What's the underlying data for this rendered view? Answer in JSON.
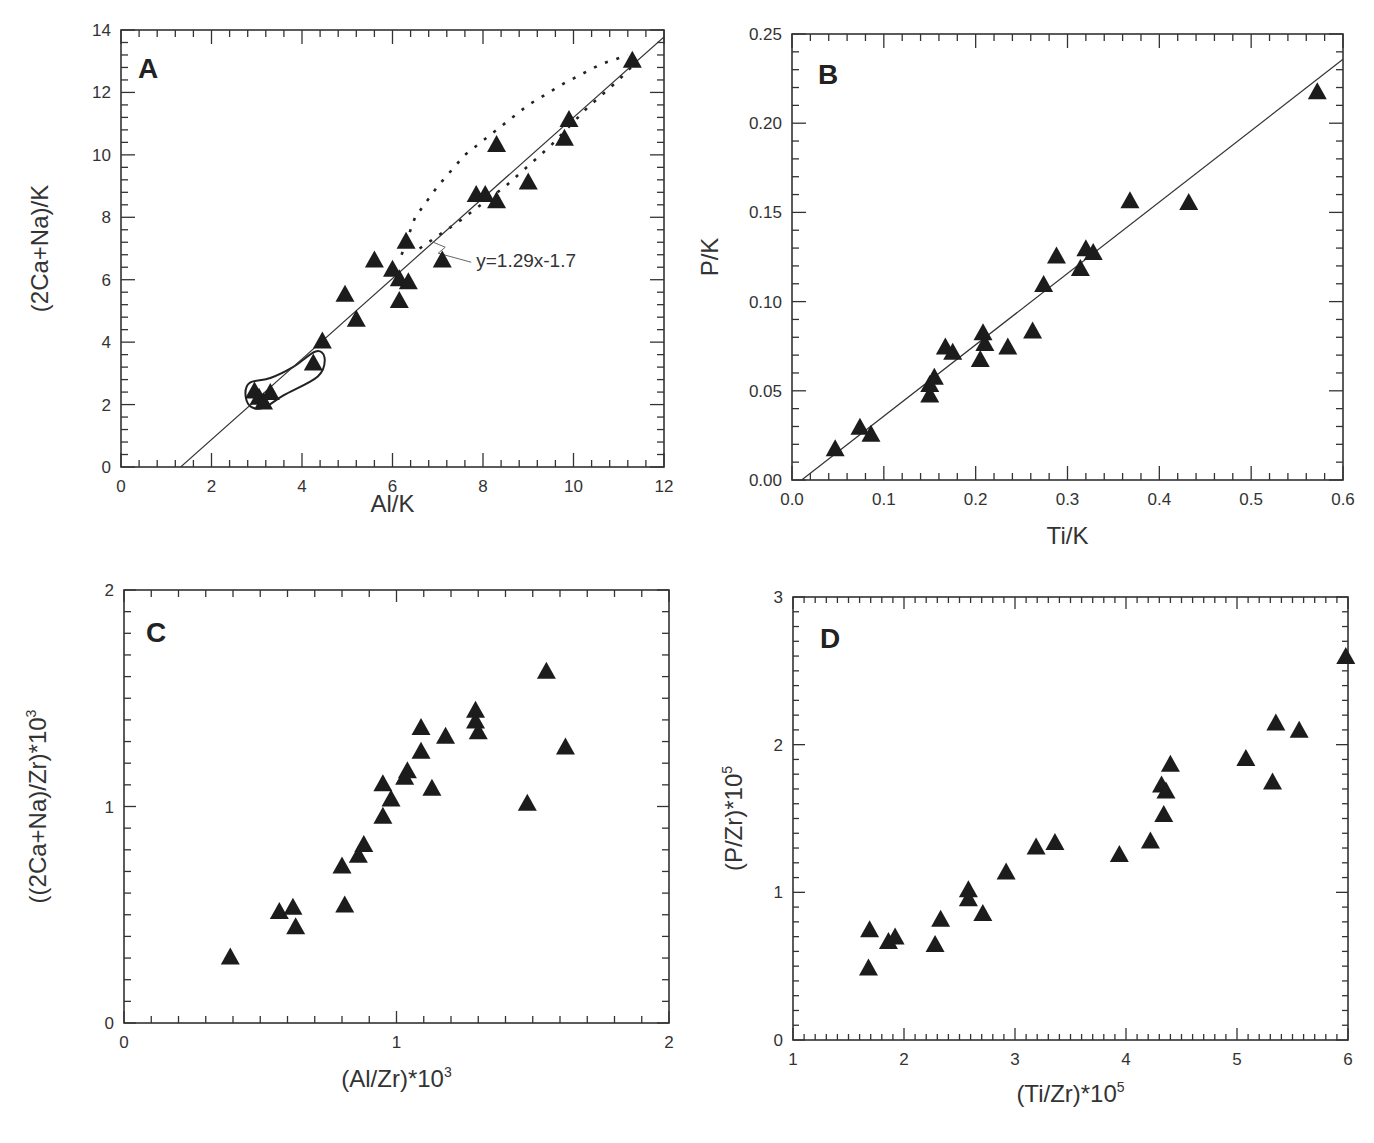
{
  "figure": {
    "marker_color": "#1c1c1c",
    "line_color": "#333333"
  },
  "chart_data": [
    {
      "id": "A",
      "type": "scatter",
      "panel_letter": "A",
      "xlabel": "Al/K",
      "ylabel": "(2Ca+Na)/K",
      "xlim": [
        0,
        12
      ],
      "ylim": [
        0,
        14
      ],
      "x_ticks": [
        0,
        2,
        4,
        6,
        8,
        10,
        12
      ],
      "y_ticks": [
        0,
        2,
        4,
        6,
        8,
        10,
        12,
        14
      ],
      "x_minor_step": 0.4,
      "y_minor_step": 0.4,
      "marker": "triangle",
      "grid": false,
      "fit": {
        "slope": 1.29,
        "intercept": -1.7,
        "label": "y=1.29x-1.7",
        "x_range": [
          1.32,
          12
        ]
      },
      "annotations": [
        {
          "type": "dotted-envelope",
          "upper": [
            [
              6.2,
              6.8
            ],
            [
              6.5,
              8.0
            ],
            [
              7.0,
              9.0
            ],
            [
              7.6,
              10.0
            ],
            [
              8.3,
              10.8
            ],
            [
              9.0,
              11.6
            ],
            [
              9.8,
              12.3
            ],
            [
              10.6,
              12.9
            ],
            [
              11.2,
              13.2
            ]
          ],
          "lower": [
            [
              6.6,
              7.0
            ],
            [
              7.5,
              7.9
            ],
            [
              8.5,
              9.0
            ],
            [
              9.5,
              10.3
            ],
            [
              10.3,
              11.5
            ],
            [
              11.0,
              12.4
            ],
            [
              11.4,
              13.0
            ]
          ]
        },
        {
          "type": "enclosed-field",
          "points": [
            [
              2.75,
              2.35
            ],
            [
              2.85,
              2.7
            ],
            [
              3.3,
              2.85
            ],
            [
              3.8,
              3.2
            ],
            [
              4.3,
              3.7
            ],
            [
              4.5,
              3.5
            ],
            [
              4.35,
              2.9
            ],
            [
              3.6,
              2.3
            ],
            [
              3.15,
              1.9
            ],
            [
              2.85,
              1.95
            ]
          ]
        }
      ],
      "points": [
        [
          2.95,
          2.4
        ],
        [
          3.05,
          2.2
        ],
        [
          3.15,
          2.05
        ],
        [
          3.3,
          2.35
        ],
        [
          4.25,
          3.3
        ],
        [
          4.45,
          4.0
        ],
        [
          4.95,
          5.5
        ],
        [
          5.2,
          4.7
        ],
        [
          5.6,
          6.6
        ],
        [
          6.0,
          6.3
        ],
        [
          6.15,
          6.0
        ],
        [
          6.15,
          5.3
        ],
        [
          6.35,
          5.9
        ],
        [
          6.3,
          7.2
        ],
        [
          7.1,
          6.6
        ],
        [
          7.85,
          8.7
        ],
        [
          8.05,
          8.7
        ],
        [
          8.3,
          8.5
        ],
        [
          8.3,
          10.3
        ],
        [
          9.0,
          9.1
        ],
        [
          9.8,
          10.5
        ],
        [
          9.9,
          11.1
        ],
        [
          11.3,
          13.0
        ]
      ]
    },
    {
      "id": "B",
      "type": "scatter",
      "panel_letter": "B",
      "xlabel": "Ti/K",
      "ylabel": "P/K",
      "xlim": [
        0,
        0.6
      ],
      "ylim": [
        0,
        0.25
      ],
      "x_ticks": [
        "0.0",
        "0.1",
        "0.2",
        "0.3",
        "0.4",
        "0.5",
        "0.6"
      ],
      "y_ticks": [
        "0.00",
        "0.05",
        "0.10",
        "0.15",
        "0.20",
        "0.25"
      ],
      "x_minor_step": 0.02,
      "y_minor_step": 0.01,
      "marker": "triangle",
      "grid": false,
      "fit": {
        "slope": 0.4,
        "intercept": -0.0042,
        "label": "",
        "x_range": [
          0.0105,
          0.6
        ]
      },
      "points": [
        [
          0.047,
          0.017
        ],
        [
          0.074,
          0.029
        ],
        [
          0.086,
          0.025
        ],
        [
          0.15,
          0.047
        ],
        [
          0.15,
          0.053
        ],
        [
          0.155,
          0.057
        ],
        [
          0.167,
          0.074
        ],
        [
          0.175,
          0.071
        ],
        [
          0.205,
          0.067
        ],
        [
          0.208,
          0.082
        ],
        [
          0.21,
          0.076
        ],
        [
          0.235,
          0.074
        ],
        [
          0.262,
          0.083
        ],
        [
          0.274,
          0.109
        ],
        [
          0.288,
          0.125
        ],
        [
          0.314,
          0.118
        ],
        [
          0.32,
          0.129
        ],
        [
          0.328,
          0.127
        ],
        [
          0.368,
          0.156
        ],
        [
          0.432,
          0.155
        ],
        [
          0.572,
          0.217
        ]
      ]
    },
    {
      "id": "C",
      "type": "scatter",
      "panel_letter": "C",
      "xlabel": "(Al/Zr)*10",
      "xlabel_sup": "3",
      "ylabel": "((2Ca+Na)/Zr)*10",
      "ylabel_sup": "3",
      "xlim": [
        0,
        2
      ],
      "ylim": [
        0,
        2
      ],
      "x_ticks": [
        0,
        1,
        2
      ],
      "y_ticks": [
        0,
        1,
        2
      ],
      "x_minor_step": 0.1,
      "y_minor_step": 0.1,
      "marker": "triangle",
      "grid": false,
      "points": [
        [
          0.39,
          0.3
        ],
        [
          0.57,
          0.51
        ],
        [
          0.62,
          0.53
        ],
        [
          0.63,
          0.44
        ],
        [
          0.8,
          0.72
        ],
        [
          0.81,
          0.54
        ],
        [
          0.86,
          0.77
        ],
        [
          0.88,
          0.82
        ],
        [
          0.95,
          0.95
        ],
        [
          0.95,
          1.1
        ],
        [
          0.98,
          1.03
        ],
        [
          1.03,
          1.13
        ],
        [
          1.04,
          1.16
        ],
        [
          1.09,
          1.36
        ],
        [
          1.09,
          1.25
        ],
        [
          1.13,
          1.08
        ],
        [
          1.18,
          1.32
        ],
        [
          1.29,
          1.44
        ],
        [
          1.29,
          1.39
        ],
        [
          1.3,
          1.34
        ],
        [
          1.48,
          1.01
        ],
        [
          1.55,
          1.62
        ],
        [
          1.62,
          1.27
        ]
      ]
    },
    {
      "id": "D",
      "type": "scatter",
      "panel_letter": "D",
      "xlabel": "(Ti/Zr)*10",
      "xlabel_sup": "5",
      "ylabel": "(P/Zr)*10",
      "ylabel_sup": "5",
      "xlim": [
        1,
        6
      ],
      "ylim": [
        0,
        3
      ],
      "x_ticks": [
        1,
        2,
        3,
        4,
        5,
        6
      ],
      "y_ticks": [
        0,
        1,
        2,
        3
      ],
      "x_minor_step": 0.1,
      "y_minor_step": 0.1,
      "marker": "triangle",
      "grid": false,
      "points": [
        [
          1.68,
          0.48
        ],
        [
          1.69,
          0.74
        ],
        [
          1.86,
          0.66
        ],
        [
          1.92,
          0.69
        ],
        [
          2.28,
          0.64
        ],
        [
          2.33,
          0.81
        ],
        [
          2.58,
          1.01
        ],
        [
          2.58,
          0.95
        ],
        [
          2.71,
          0.85
        ],
        [
          2.92,
          1.13
        ],
        [
          3.19,
          1.3
        ],
        [
          3.36,
          1.33
        ],
        [
          3.94,
          1.25
        ],
        [
          4.22,
          1.34
        ],
        [
          4.32,
          1.72
        ],
        [
          4.36,
          1.68
        ],
        [
          4.34,
          1.52
        ],
        [
          4.4,
          1.86
        ],
        [
          5.08,
          1.9
        ],
        [
          5.32,
          1.74
        ],
        [
          5.35,
          2.14
        ],
        [
          5.56,
          2.09
        ],
        [
          5.98,
          2.59
        ]
      ]
    }
  ]
}
